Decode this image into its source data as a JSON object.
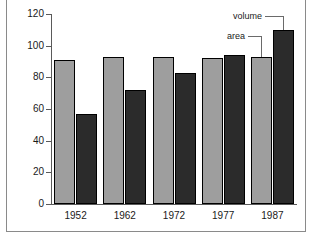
{
  "chart_data": {
    "type": "bar",
    "title": "",
    "xlabel": "",
    "ylabel": "",
    "categories": [
      "1952",
      "1962",
      "1972",
      "1977",
      "1987"
    ],
    "series": [
      {
        "name": "area",
        "color": "#9e9e9e",
        "values": [
          91,
          93,
          93,
          92,
          93
        ]
      },
      {
        "name": "volume",
        "color": "#2b2b2b",
        "values": [
          57,
          72,
          83,
          94,
          110
        ]
      }
    ],
    "ylim": [
      0,
      120
    ],
    "yticks": [
      0,
      20,
      40,
      60,
      80,
      100,
      120
    ],
    "ytick_labels": [
      "0",
      "20",
      "40",
      "60",
      "80",
      "100",
      "120"
    ],
    "grid": false,
    "legend_position": "annotation-leaders-top-right",
    "annotations": [
      {
        "text": "volume",
        "points_to": "1987-volume-bar"
      },
      {
        "text": "area",
        "points_to": "1987-area-bar"
      }
    ]
  },
  "axis": {
    "tick_labels": [
      "120",
      "100",
      "80",
      "60",
      "40",
      "20",
      "0"
    ]
  },
  "annotations": {
    "volume_label": "volume",
    "area_label": "area"
  },
  "colors": {
    "area": "#9e9e9e",
    "volume": "#2b2b2b",
    "axis": "#5a5a5a",
    "frame": "#8a8a8a"
  }
}
